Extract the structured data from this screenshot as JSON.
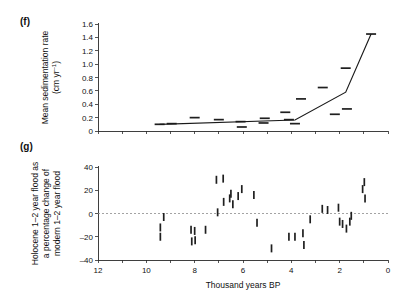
{
  "figure": {
    "panel_f_tag": "(f)",
    "panel_g_tag": "(g)",
    "xlabel": "Thousand years BP",
    "background_color": "#ffffff",
    "marker_color": "#1f1f1f",
    "line_color": "#1a1a1a",
    "zero_line_color": "#8c8c8c"
  },
  "chart_data": [
    {
      "type": "scatter",
      "panel": "(f)",
      "title": "",
      "ylabel": "Mean sedimentation rate (cm yr⁻¹)",
      "ylabel_line1": "Mean sedimentation rate",
      "ylabel_line2": "(cm yr",
      "ylabel_exp": "–1",
      "ylabel_line2_close": ")",
      "xlabel": "Thousand years BP",
      "xlim": [
        12,
        0
      ],
      "ylim": [
        0,
        1.6
      ],
      "xticks": [
        12,
        11,
        10,
        9,
        8,
        7,
        6,
        5,
        4,
        3,
        2,
        1,
        0
      ],
      "xticklabels": [
        "",
        "",
        "",
        "",
        "",
        "",
        "",
        "",
        "",
        "",
        "",
        "",
        ""
      ],
      "yticks": [
        0,
        0.2,
        0.4,
        0.6,
        0.8,
        1.0,
        1.2,
        1.4,
        1.6
      ],
      "yticklabels": [
        "0",
        "0.2",
        "0.4",
        "0.6",
        "0.8",
        "1.0",
        "1.2",
        "1.4",
        "1.6"
      ],
      "grid": false,
      "legend": "none",
      "marker_style": "horizontal-dash",
      "points": [
        {
          "x": 9.45,
          "y": 0.1
        },
        {
          "x": 8.95,
          "y": 0.11
        },
        {
          "x": 8.0,
          "y": 0.2
        },
        {
          "x": 7.0,
          "y": 0.17
        },
        {
          "x": 6.1,
          "y": 0.14
        },
        {
          "x": 6.05,
          "y": 0.06
        },
        {
          "x": 5.1,
          "y": 0.19
        },
        {
          "x": 5.15,
          "y": 0.12
        },
        {
          "x": 4.25,
          "y": 0.28
        },
        {
          "x": 4.1,
          "y": 0.17
        },
        {
          "x": 3.85,
          "y": 0.11
        },
        {
          "x": 3.6,
          "y": 0.48
        },
        {
          "x": 2.7,
          "y": 0.65
        },
        {
          "x": 2.2,
          "y": 0.25
        },
        {
          "x": 1.75,
          "y": 0.94
        },
        {
          "x": 1.7,
          "y": 0.33
        },
        {
          "x": 0.7,
          "y": 1.45
        }
      ],
      "trend": {
        "name": "sedimentation trend",
        "x": [
          9.45,
          3.85,
          1.75,
          0.7
        ],
        "y": [
          0.1,
          0.165,
          0.58,
          1.45
        ]
      }
    },
    {
      "type": "scatter",
      "panel": "(g)",
      "title": "",
      "ylabel": "Holocene 1–2 year flood as a percentage change of modern 1–2 year flood",
      "ylabel_line1": "Holocene 1–2 year flood as",
      "ylabel_line2": "a percentage change of",
      "ylabel_line3": "modern 1–2 year flood",
      "xlabel": "Thousand years BP",
      "xlim": [
        12,
        0
      ],
      "ylim": [
        -40,
        40
      ],
      "xticks": [
        12,
        11,
        10,
        9,
        8,
        7,
        6,
        5,
        4,
        3,
        2,
        1,
        0
      ],
      "xticklabels": [
        "12",
        "",
        "10",
        "",
        "8",
        "",
        "6",
        "",
        "4",
        "",
        "2",
        "",
        "0"
      ],
      "yticks": [
        -40,
        -20,
        0,
        20,
        40
      ],
      "yticklabels": [
        "–40",
        "–20",
        "0",
        "20",
        "40"
      ],
      "grid": false,
      "legend": "none",
      "marker_style": "vertical-bar",
      "zero_reference_line": 0,
      "points": [
        {
          "x": 9.42,
          "y": -12
        },
        {
          "x": 9.42,
          "y": -20
        },
        {
          "x": 9.28,
          "y": -3
        },
        {
          "x": 8.15,
          "y": -14
        },
        {
          "x": 8.12,
          "y": -24
        },
        {
          "x": 8.0,
          "y": -15
        },
        {
          "x": 7.98,
          "y": -23
        },
        {
          "x": 7.55,
          "y": -14
        },
        {
          "x": 7.1,
          "y": 29
        },
        {
          "x": 7.05,
          "y": 1
        },
        {
          "x": 6.82,
          "y": 30
        },
        {
          "x": 6.8,
          "y": 10
        },
        {
          "x": 6.55,
          "y": 13
        },
        {
          "x": 6.5,
          "y": 17
        },
        {
          "x": 6.42,
          "y": 8
        },
        {
          "x": 6.2,
          "y": 15
        },
        {
          "x": 6.05,
          "y": 21
        },
        {
          "x": 5.55,
          "y": 16
        },
        {
          "x": 5.42,
          "y": -8
        },
        {
          "x": 4.82,
          "y": -30
        },
        {
          "x": 4.1,
          "y": -20
        },
        {
          "x": 3.85,
          "y": -20
        },
        {
          "x": 3.52,
          "y": -17
        },
        {
          "x": 3.48,
          "y": -27
        },
        {
          "x": 3.22,
          "y": -5
        },
        {
          "x": 2.72,
          "y": 4
        },
        {
          "x": 2.5,
          "y": 3
        },
        {
          "x": 2.05,
          "y": 5
        },
        {
          "x": 2.0,
          "y": -7
        },
        {
          "x": 1.88,
          "y": -9
        },
        {
          "x": 1.72,
          "y": -13
        },
        {
          "x": 1.58,
          "y": -7
        },
        {
          "x": 1.52,
          "y": -2
        },
        {
          "x": 1.05,
          "y": 21
        },
        {
          "x": 0.98,
          "y": 27
        },
        {
          "x": 0.95,
          "y": 13
        }
      ]
    }
  ]
}
